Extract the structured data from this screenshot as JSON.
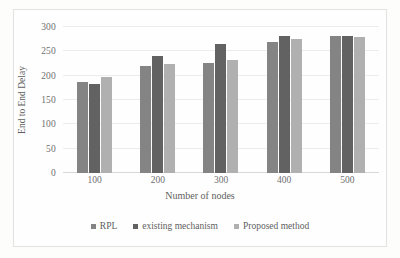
{
  "chart_data": {
    "type": "bar",
    "title": "",
    "xlabel": "Number of nodes",
    "ylabel": "End to End Delay",
    "categories": [
      "100",
      "200",
      "300",
      "400",
      "500"
    ],
    "series": [
      {
        "name": "RPL",
        "color": "#848484",
        "values": [
          188,
          220,
          227,
          270,
          281
        ]
      },
      {
        "name": "existing mechanism",
        "color": "#626262",
        "values": [
          182,
          241,
          265,
          282,
          282
        ]
      },
      {
        "name": "Proposed method",
        "color": "#b0b0b0",
        "values": [
          197,
          224,
          233,
          276,
          279
        ]
      }
    ],
    "ylim": [
      0,
      300
    ],
    "yticks": [
      0,
      50,
      100,
      150,
      200,
      250,
      300
    ],
    "ytick_labels": [
      "0",
      "50",
      "100",
      "150",
      "200",
      "250",
      "300"
    ],
    "grid": true,
    "legend_position": "bottom"
  },
  "axes": {
    "y_title": "End to End Delay",
    "x_title": "Number of nodes"
  },
  "legend": {
    "items": [
      {
        "label": "RPL",
        "color": "#848484"
      },
      {
        "label": "existing mechanism",
        "color": "#626262"
      },
      {
        "label": "Proposed method",
        "color": "#b0b0b0"
      }
    ]
  },
  "colors": {
    "series_1": "#848484",
    "series_2": "#626262",
    "series_3": "#b0b0b0",
    "gridline": "#ececeb",
    "text": "#6f6f6f",
    "background": "#fefefe"
  }
}
